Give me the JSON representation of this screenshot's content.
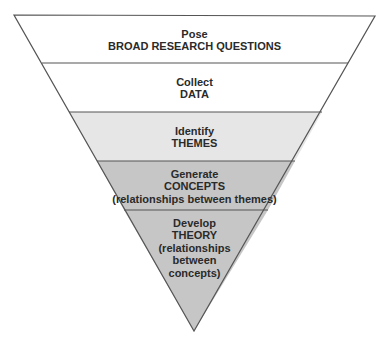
{
  "diagram": {
    "type": "inverted-funnel",
    "stages": [
      {
        "verb": "Pose",
        "object": "BROAD RESEARCH QUESTIONS",
        "note": null,
        "fill": "#ffffff"
      },
      {
        "verb": "Collect",
        "object": "DATA",
        "note": null,
        "fill": "#ffffff"
      },
      {
        "verb": "Identify",
        "object": "THEMES",
        "note": null,
        "fill": "#e6e6e6"
      },
      {
        "verb": "Generate",
        "object": "CONCEPTS",
        "note": "(relationships between themes)",
        "fill": "#c6c6c6"
      },
      {
        "verb": "Develop",
        "object": "THEORY",
        "note_lines": [
          "(relationships",
          "between",
          "concepts)"
        ],
        "fill": "#c6c6c6"
      }
    ],
    "stroke_color": "#555555"
  }
}
